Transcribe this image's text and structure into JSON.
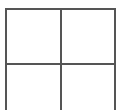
{
  "diagram": {
    "type": "grid",
    "rows": 2,
    "columns": 2,
    "line_color": "#555555",
    "background_color": "#ffffff",
    "bottom_border_visible": false,
    "cells": [
      {
        "row": 1,
        "col": 1,
        "content": ""
      },
      {
        "row": 1,
        "col": 2,
        "content": ""
      },
      {
        "row": 2,
        "col": 1,
        "content": ""
      },
      {
        "row": 2,
        "col": 2,
        "content": ""
      }
    ]
  }
}
